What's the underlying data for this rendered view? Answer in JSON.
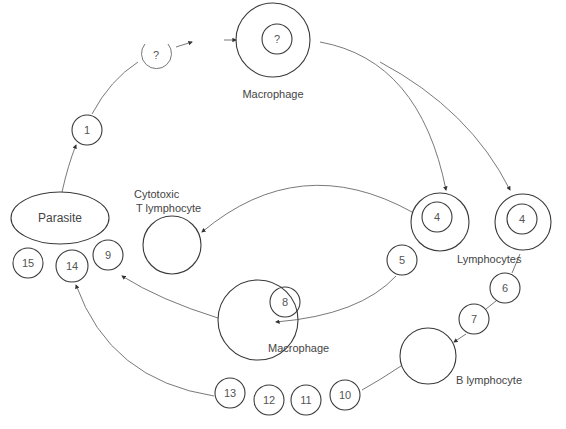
{
  "diagram": {
    "type": "immune response cycle",
    "colors": {
      "stroke": "#3a3a3a",
      "text": "#444444",
      "arrow": "#6a6a6a",
      "background": "#ffffff"
    },
    "labels": {
      "parasite": "Parasite",
      "macrophage_top": "Macrophage",
      "cytotoxic_line1": "Cytotoxic",
      "cytotoxic_line2": "T lymphocyte",
      "lymphocytes": "Lymphocytes",
      "macrophage_mid": "Macrophage",
      "b_lymphocyte": "B lymphocyte"
    },
    "nodes": {
      "n1": "1",
      "n2": "?",
      "n3": "?",
      "n4a": "4",
      "n4b": "4",
      "n5": "5",
      "n6": "6",
      "n7": "7",
      "n8": "8",
      "n9": "9",
      "n10": "10",
      "n11": "11",
      "n12": "12",
      "n13": "13",
      "n14": "14",
      "n15": "15"
    },
    "edges": [
      {
        "from": "Parasite",
        "to": "1"
      },
      {
        "from": "1",
        "to": "2"
      },
      {
        "from": "2",
        "to": "Macrophage (3)"
      },
      {
        "from": "Macrophage (3)",
        "to": "Lymphocyte 4 (left)"
      },
      {
        "from": "Macrophage (3)",
        "to": "Lymphocyte 4 (right)"
      },
      {
        "from": "Lymphocyte 4 (left)",
        "to": "Cytotoxic T lymphocyte"
      },
      {
        "from": "5",
        "to": "Macrophage (lower)"
      },
      {
        "from": "Macrophage (lower)",
        "to": "9"
      },
      {
        "from": "Lymphocyte 4 (right)",
        "to": "6"
      },
      {
        "from": "7",
        "to": "B lymphocyte"
      },
      {
        "from": "B lymphocyte",
        "to": "10"
      },
      {
        "from": "13",
        "to": "14"
      }
    ]
  }
}
